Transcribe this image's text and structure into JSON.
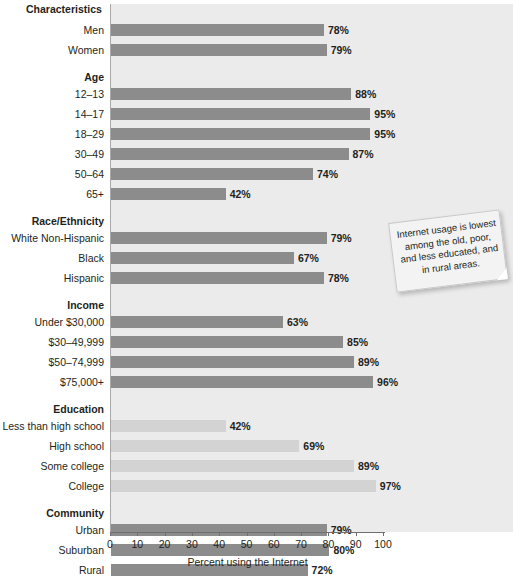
{
  "chart_data": {
    "type": "bar",
    "orientation": "horizontal",
    "title": "",
    "xlabel": "Percent using the Internet",
    "ylabel": "",
    "xlim": [
      0,
      100
    ],
    "grid": false,
    "legend": "none",
    "column_header": "Characteristics",
    "tick_labels": [
      "0",
      "10",
      "20",
      "30",
      "40",
      "50",
      "60",
      "70",
      "80",
      "90",
      "100"
    ],
    "ticks": [
      0,
      10,
      20,
      30,
      40,
      50,
      60,
      70,
      80,
      90,
      100
    ],
    "colors": {
      "bar_default": "#8c8c8c",
      "bar_light": "#d3d3d3",
      "plot_background": "#ebebeb",
      "text": "#231f20"
    },
    "annotations": [
      {
        "text": "Internet usage is lowest among the old, poor, and less educated, and in rural areas.",
        "style": "sticky-note"
      }
    ],
    "groups": [
      {
        "name": "",
        "rows": [
          {
            "label": "Men",
            "value": 78,
            "value_label": "78%",
            "shade": "default"
          },
          {
            "label": "Women",
            "value": 79,
            "value_label": "79%",
            "shade": "default"
          }
        ]
      },
      {
        "name": "Age",
        "rows": [
          {
            "label": "12–13",
            "value": 88,
            "value_label": "88%",
            "shade": "default"
          },
          {
            "label": "14–17",
            "value": 95,
            "value_label": "95%",
            "shade": "default"
          },
          {
            "label": "18–29",
            "value": 95,
            "value_label": "95%",
            "shade": "default"
          },
          {
            "label": "30–49",
            "value": 87,
            "value_label": "87%",
            "shade": "default"
          },
          {
            "label": "50–64",
            "value": 74,
            "value_label": "74%",
            "shade": "default"
          },
          {
            "label": "65+",
            "value": 42,
            "value_label": "42%",
            "shade": "default"
          }
        ]
      },
      {
        "name": "Race/Ethnicity",
        "rows": [
          {
            "label": "White Non-Hispanic",
            "value": 79,
            "value_label": "79%",
            "shade": "default"
          },
          {
            "label": "Black",
            "value": 67,
            "value_label": "67%",
            "shade": "default"
          },
          {
            "label": "Hispanic",
            "value": 78,
            "value_label": "78%",
            "shade": "default"
          }
        ]
      },
      {
        "name": "Income",
        "rows": [
          {
            "label": "Under $30,000",
            "value": 63,
            "value_label": "63%",
            "shade": "default"
          },
          {
            "label": "$30–49,999",
            "value": 85,
            "value_label": "85%",
            "shade": "default"
          },
          {
            "label": "$50–74,999",
            "value": 89,
            "value_label": "89%",
            "shade": "default"
          },
          {
            "label": "$75,000+",
            "value": 96,
            "value_label": "96%",
            "shade": "default"
          }
        ]
      },
      {
        "name": "Education",
        "rows": [
          {
            "label": "Less than high school",
            "value": 42,
            "value_label": "42%",
            "shade": "light"
          },
          {
            "label": "High school",
            "value": 69,
            "value_label": "69%",
            "shade": "light"
          },
          {
            "label": "Some college",
            "value": 89,
            "value_label": "89%",
            "shade": "light"
          },
          {
            "label": "College",
            "value": 97,
            "value_label": "97%",
            "shade": "light"
          }
        ]
      },
      {
        "name": "Community",
        "rows": [
          {
            "label": "Urban",
            "value": 79,
            "value_label": "79%",
            "shade": "default"
          },
          {
            "label": "Suburban",
            "value": 80,
            "value_label": "80%",
            "shade": "default"
          },
          {
            "label": "Rural",
            "value": 72,
            "value_label": "72%",
            "shade": "default"
          }
        ]
      }
    ]
  }
}
